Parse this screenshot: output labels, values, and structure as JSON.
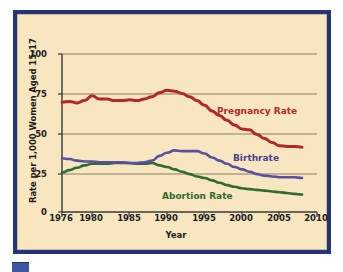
{
  "chart_data": {
    "type": "line",
    "title": "",
    "xlabel": "Year",
    "ylabel": "Rate per 1,000 Women Aged 15–17",
    "xlim": [
      1976,
      2010
    ],
    "ylim": [
      0,
      100
    ],
    "grid": true,
    "legend_position": "inline-annotations",
    "x_ticks": [
      "1976",
      "1980",
      "1985",
      "1990",
      "1995",
      "2000",
      "2005",
      "2010"
    ],
    "x_tick_values": [
      1976,
      1980,
      1985,
      1990,
      1995,
      2000,
      2005,
      2010
    ],
    "y_ticks": [
      "0",
      "25",
      "50",
      "75",
      "100"
    ],
    "y_tick_values": [
      0,
      25,
      50,
      75,
      100
    ],
    "x": [
      1976,
      1977,
      1978,
      1979,
      1980,
      1981,
      1982,
      1983,
      1984,
      1985,
      1986,
      1987,
      1988,
      1989,
      1990,
      1991,
      1992,
      1993,
      1994,
      1995,
      1996,
      1997,
      1998,
      1999,
      2000,
      2001,
      2002,
      2003,
      2004,
      2005,
      2006,
      2007,
      2008
    ],
    "series": [
      {
        "name": "Pregnancy Rate",
        "color": "#b3282b",
        "values": [
          69.5,
          70.0,
          69.0,
          70.5,
          73.5,
          71.5,
          71.5,
          70.5,
          70.5,
          71.0,
          70.5,
          71.5,
          73.0,
          75.5,
          77.0,
          76.5,
          75.0,
          73.0,
          70.5,
          67.5,
          64.0,
          61.0,
          58.0,
          55.0,
          52.5,
          52.0,
          49.0,
          46.5,
          44.0,
          42.0,
          41.5,
          41.5,
          41.0
        ]
      },
      {
        "name": "Birthrate",
        "color": "#5a4fa3",
        "values": [
          34.0,
          33.5,
          32.5,
          32.0,
          32.0,
          31.5,
          31.5,
          31.5,
          31.5,
          31.0,
          31.0,
          31.5,
          32.5,
          35.5,
          37.5,
          39.0,
          38.5,
          38.5,
          38.5,
          37.0,
          34.5,
          32.5,
          30.5,
          28.5,
          27.0,
          25.5,
          24.0,
          23.0,
          22.5,
          22.0,
          22.0,
          22.0,
          21.5
        ]
      },
      {
        "name": "Abortion Rate",
        "color": "#2f6b33",
        "values": [
          25.0,
          26.5,
          28.0,
          29.5,
          30.5,
          30.5,
          30.5,
          31.0,
          31.0,
          31.0,
          30.5,
          30.5,
          31.0,
          29.5,
          28.5,
          27.0,
          25.5,
          24.0,
          22.5,
          21.5,
          20.0,
          18.5,
          17.0,
          16.0,
          15.0,
          14.5,
          14.0,
          13.5,
          13.0,
          12.5,
          12.0,
          11.5,
          11.0
        ]
      }
    ],
    "annotations": [
      {
        "text": "Pregnancy Rate",
        "color": "#b3282b",
        "x": 1999,
        "y": 58
      },
      {
        "text": "Birthrate",
        "color": "#4a3f93",
        "y": 30,
        "x": 2001
      },
      {
        "text": "Abortion Rate",
        "color": "#2f6b33",
        "y": 9,
        "x": 1995
      }
    ]
  },
  "style": {
    "background": "#f7e6c0",
    "border": "#23357a",
    "gridline": "#8a7f63",
    "axis": "#3a3a3a",
    "text": "#1d1d1d"
  }
}
